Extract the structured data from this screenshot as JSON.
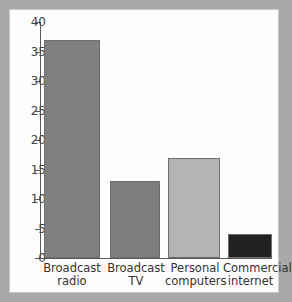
{
  "figure": {
    "background_color": "#fdfdfd",
    "margin_color": "#a9a9a9"
  },
  "chart_data": {
    "type": "bar",
    "title": "",
    "subtitle": "",
    "xlabel": "",
    "ylabel": "",
    "categories": [
      "Broadcast\nradio",
      "Broadcast\nTV",
      "Personal\ncomputers",
      "Commercial\ninternet"
    ],
    "values": [
      37,
      13,
      17,
      4
    ],
    "bar_colors": [
      "#808080",
      "#7e7e7e",
      "#b4b4b4",
      "#222222"
    ],
    "ylim": [
      0,
      40
    ],
    "ytick_values": [
      0,
      5,
      10,
      15,
      20,
      25,
      30,
      35,
      40
    ],
    "ytick_labels": [
      "0",
      "5",
      "10",
      "15",
      "20",
      "25",
      "30",
      "35",
      "40"
    ],
    "grid": false,
    "legend": null,
    "annotations": []
  }
}
